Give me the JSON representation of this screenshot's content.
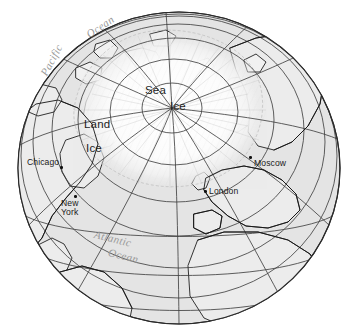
{
  "map": {
    "projection": "orthographic-arctic-globe",
    "title_labels": {
      "sea": "Sea",
      "ice_center": "Ice",
      "land": "Land",
      "ice_land": "Ice"
    },
    "ocean_labels": [
      {
        "name": "pacific-ocean",
        "line1": "Pacific",
        "line2": "Ocean"
      },
      {
        "name": "atlantic-ocean",
        "line1": "Atlantic",
        "line2": "Ocean"
      }
    ],
    "cities": [
      {
        "name": "chicago",
        "label": "Chicago"
      },
      {
        "name": "new-york",
        "label_line1": "New",
        "label_line2": "York"
      },
      {
        "name": "london",
        "label": "London"
      },
      {
        "name": "moscow",
        "label": "Moscow"
      }
    ],
    "colors": {
      "ocean_fill": "#e4e4e4",
      "land_fill": "#efefef",
      "ice_fill": "#fbfbfb",
      "graticule": "#3a3a3a",
      "coastline": "#151515",
      "globe_outline": "#2a2a2a",
      "ocean_text": "#9a9a9a",
      "label_text": "#1a1a1a",
      "background": "#ffffff"
    },
    "graticule": {
      "parallels": [
        80,
        70,
        60,
        50,
        40,
        30,
        20,
        10,
        0
      ],
      "meridian_spacing_deg": 30,
      "pole_center_x": 172,
      "pole_center_y": 108
    }
  }
}
